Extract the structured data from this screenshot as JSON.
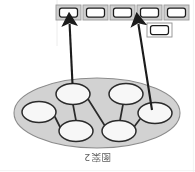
{
  "figure": {
    "caption": "图案2",
    "caption_orientation": "rotated-180",
    "background_color": "#ffffff"
  },
  "colors": {
    "region_fill": "#d2d2d2",
    "region_stroke": "#8c8c8c",
    "node_fill": "#f7f7f7",
    "node_stroke": "#2b2b2b",
    "edge_stroke": "#2b2b2b",
    "arrow_stroke": "#1a1a1a",
    "box_outer_fill": "#cfcfcf",
    "box_outer_stroke": "#9a9a9a",
    "box_inner_fill": "#ffffff",
    "box_inner_stroke": "#1f1f1f",
    "caption_color": "#4a4a4a",
    "scan_line_color": "#c9c9c9"
  },
  "top_row": {
    "name": "feature-vector-row",
    "count": 5,
    "boxes": [
      {
        "index": 1,
        "label": "",
        "x": 56,
        "y": 5,
        "w": 25,
        "h": 15
      },
      {
        "index": 2,
        "label": "",
        "x": 83,
        "y": 5,
        "w": 25,
        "h": 15
      },
      {
        "index": 3,
        "label": "",
        "x": 110,
        "y": 5,
        "w": 25,
        "h": 15
      },
      {
        "index": 4,
        "label": "",
        "x": 137,
        "y": 5,
        "w": 25,
        "h": 15
      },
      {
        "index": 5,
        "label": "",
        "x": 164,
        "y": 5,
        "w": 25,
        "h": 15
      }
    ]
  },
  "extra_box": {
    "name": "detached-feature-box",
    "label": "",
    "x": 147,
    "y": 23,
    "w": 25,
    "h": 14
  },
  "arrows": [
    {
      "name": "arrow-left",
      "from_node": 1,
      "to_box": 1,
      "x1": 72.5,
      "y1": 84,
      "x2": 69.5,
      "y2": 22
    },
    {
      "name": "arrow-right",
      "from_node": 4,
      "to_box": 4,
      "x1": 152,
      "y1": 110,
      "x2": 138,
      "y2": 22
    }
  ],
  "region": {
    "name": "graph-region-ellipse",
    "cx": 97,
    "cy": 113,
    "rx": 83,
    "ry": 35
  },
  "graph": {
    "name": "node-link-graph",
    "node_count": 6,
    "edge_count": 5,
    "nodes": [
      {
        "id": 1,
        "label": "",
        "cx": 73,
        "cy": 94,
        "rx": 17,
        "ry": 10.5
      },
      {
        "id": 2,
        "label": "",
        "cx": 39,
        "cy": 112,
        "rx": 17,
        "ry": 10.5
      },
      {
        "id": 3,
        "label": "",
        "cx": 126,
        "cy": 94,
        "rx": 17,
        "ry": 10.5
      },
      {
        "id": 4,
        "label": "",
        "cx": 155,
        "cy": 113,
        "rx": 17,
        "ry": 10.5
      },
      {
        "id": 5,
        "label": "",
        "cx": 76,
        "cy": 131,
        "rx": 17,
        "ry": 10.5
      },
      {
        "id": 6,
        "label": "",
        "cx": 119,
        "cy": 131,
        "rx": 17,
        "ry": 10.5
      }
    ],
    "edges": [
      {
        "source": 1,
        "target": 5
      },
      {
        "source": 1,
        "target": 6
      },
      {
        "source": 2,
        "target": 5
      },
      {
        "source": 3,
        "target": 6
      },
      {
        "source": 4,
        "target": 6
      }
    ]
  }
}
